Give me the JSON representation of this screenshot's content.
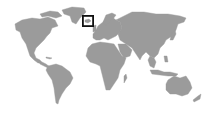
{
  "map": {
    "type": "world-locator-map",
    "projection": "equirectangular-ish",
    "background_color": "#ffffff",
    "land_color": "#9b9b9b",
    "marker": {
      "shape": "square",
      "region": "Iceland / North Atlantic",
      "color": "#111111",
      "x": 82,
      "y": 15,
      "width": 12,
      "height": 12
    },
    "continents": [
      "North America",
      "Greenland",
      "South America",
      "Europe",
      "Africa",
      "Asia",
      "Australia",
      "New Zealand"
    ]
  }
}
